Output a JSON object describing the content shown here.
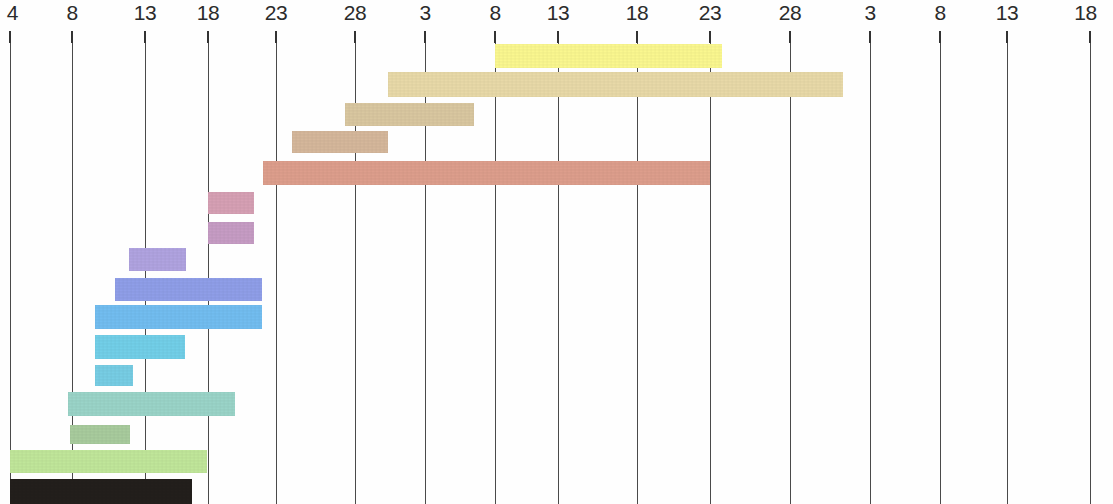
{
  "chart_data": {
    "type": "bar",
    "subtype": "gantt",
    "title": "",
    "xlabel": "",
    "ylabel": "",
    "orientation": "horizontal",
    "grid": true,
    "legend": "none",
    "axis": {
      "tick_labels": [
        "4",
        "8",
        "13",
        "18",
        "23",
        "28",
        "3",
        "8",
        "13",
        "18",
        "23",
        "28",
        "3",
        "8",
        "13",
        "18"
      ],
      "tick_x": [
        10,
        72,
        145,
        208,
        276,
        355,
        425,
        495,
        558,
        637,
        710,
        790,
        870,
        940,
        1007,
        1090
      ],
      "xlim": [
        10,
        1090
      ]
    },
    "categories": [
      "task-01",
      "task-02",
      "task-03",
      "task-04",
      "task-05",
      "task-06",
      "task-07",
      "task-08",
      "task-09",
      "task-10",
      "task-11",
      "task-12",
      "task-13",
      "task-14",
      "task-15",
      "task-16",
      "task-17"
    ],
    "bars": [
      {
        "id": "task-01",
        "color": "#faf78f",
        "x": 495,
        "y": 44,
        "w": 227,
        "h": 24,
        "start_tick": "8",
        "end_tick": "23"
      },
      {
        "id": "task-02",
        "color": "#e8d9a8",
        "x": 388,
        "y": 72,
        "w": 455,
        "h": 25,
        "start_tick": "3",
        "end_tick": "28"
      },
      {
        "id": "task-03",
        "color": "#d9c7a0",
        "x": 345,
        "y": 103,
        "w": 129,
        "h": 23,
        "start_tick": "28",
        "end_tick": "8"
      },
      {
        "id": "task-04",
        "color": "#d5b79b",
        "x": 292,
        "y": 131,
        "w": 96,
        "h": 22,
        "start_tick": "23",
        "end_tick": "3"
      },
      {
        "id": "task-05",
        "color": "#dd9e8c",
        "x": 263,
        "y": 161,
        "w": 447,
        "h": 24,
        "start_tick": "23",
        "end_tick": "23"
      },
      {
        "id": "task-06",
        "color": "#d6a0b4",
        "x": 208,
        "y": 192,
        "w": 46,
        "h": 22,
        "start_tick": "18",
        "end_tick": "18"
      },
      {
        "id": "task-07",
        "color": "#c69cc4",
        "x": 208,
        "y": 222,
        "w": 46,
        "h": 22,
        "start_tick": "18",
        "end_tick": "18"
      },
      {
        "id": "task-08",
        "color": "#b0a3e0",
        "x": 129,
        "y": 248,
        "w": 57,
        "h": 23,
        "start_tick": "13",
        "end_tick": "13"
      },
      {
        "id": "task-09",
        "color": "#8f9ee8",
        "x": 115,
        "y": 278,
        "w": 147,
        "h": 23,
        "start_tick": "13",
        "end_tick": "18"
      },
      {
        "id": "task-10",
        "color": "#72bdf0",
        "x": 95,
        "y": 305,
        "w": 167,
        "h": 24,
        "start_tick": "8",
        "end_tick": "18"
      },
      {
        "id": "task-11",
        "color": "#72cfe8",
        "x": 95,
        "y": 335,
        "w": 90,
        "h": 24,
        "start_tick": "8",
        "end_tick": "13"
      },
      {
        "id": "task-12",
        "color": "#77cde4",
        "x": 95,
        "y": 365,
        "w": 38,
        "h": 21,
        "start_tick": "8",
        "end_tick": "13"
      },
      {
        "id": "task-13",
        "color": "#9ad4c8",
        "x": 68,
        "y": 392,
        "w": 167,
        "h": 24,
        "start_tick": "8",
        "end_tick": "18"
      },
      {
        "id": "task-14",
        "color": "#a8cb9d",
        "x": 70,
        "y": 425,
        "w": 60,
        "h": 19,
        "start_tick": "8",
        "end_tick": "13"
      },
      {
        "id": "task-15",
        "color": "#c0e69a",
        "x": 10,
        "y": 450,
        "w": 197,
        "h": 23,
        "start_tick": "4",
        "end_tick": "18"
      },
      {
        "id": "task-16",
        "color": "#231f1c",
        "x": 10,
        "y": 479,
        "w": 182,
        "h": 25,
        "start_tick": "4",
        "end_tick": "18"
      }
    ]
  },
  "meta": {
    "gridline_color": "#4a4a4a",
    "background": "#fefefe",
    "text_color": "#2b2b2b"
  }
}
